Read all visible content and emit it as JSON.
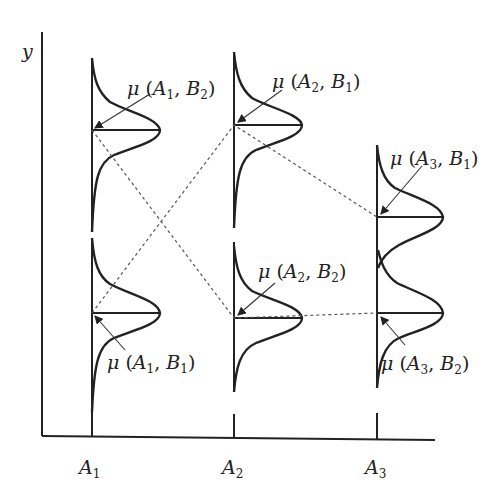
{
  "diagram": {
    "y_axis_label": "y",
    "x_axis_levels": [
      {
        "label": "A",
        "sub": "1"
      },
      {
        "label": "A",
        "sub": "2"
      },
      {
        "label": "A",
        "sub": "3"
      }
    ],
    "distributions": [
      {
        "factor_a": "A1",
        "factor_b": "B2",
        "position": "upper"
      },
      {
        "factor_a": "A1",
        "factor_b": "B1",
        "position": "lower"
      },
      {
        "factor_a": "A2",
        "factor_b": "B1",
        "position": "upper"
      },
      {
        "factor_a": "A2",
        "factor_b": "B2",
        "position": "lower"
      },
      {
        "factor_a": "A3",
        "factor_b": "B1",
        "position": "upper"
      },
      {
        "factor_a": "A3",
        "factor_b": "B2",
        "position": "lower"
      }
    ],
    "labels": {
      "a1b2": {
        "mu": "μ",
        "open": " (",
        "A": "A",
        "As": "1",
        "sep": ", ",
        "B": "B",
        "Bs": "2",
        "close": ")"
      },
      "a1b1": {
        "mu": "μ",
        "open": " (",
        "A": "A",
        "As": "1",
        "sep": ", ",
        "B": "B",
        "Bs": "1",
        "close": ")"
      },
      "a2b1": {
        "mu": "μ",
        "open": " (",
        "A": "A",
        "As": "2",
        "sep": ", ",
        "B": "B",
        "Bs": "1",
        "close": ")"
      },
      "a2b2": {
        "mu": "μ",
        "open": " (",
        "A": "A",
        "As": "2",
        "sep": ", ",
        "B": "B",
        "Bs": "2",
        "close": ")"
      },
      "a3b1": {
        "mu": "μ",
        "open": " (",
        "A": "A",
        "As": "3",
        "sep": ", ",
        "B": "B",
        "Bs": "1",
        "close": ")"
      },
      "a3b2": {
        "mu": "μ",
        "open": " (",
        "A": "A",
        "As": "3",
        "sep": ", ",
        "B": "B",
        "Bs": "2",
        "close": ")"
      }
    },
    "connections": [
      {
        "from": "μ(A1,B2)",
        "to": "μ(A2,B2)",
        "line": "B2 profile",
        "style": "dashed"
      },
      {
        "from": "μ(A2,B2)",
        "to": "μ(A3,B2)",
        "line": "B2 profile",
        "style": "dashed"
      },
      {
        "from": "μ(A1,B1)",
        "to": "μ(A2,B1)",
        "line": "B1 profile",
        "style": "dashed"
      },
      {
        "from": "μ(A2,B1)",
        "to": "μ(A3,B1)",
        "line": "B1 profile",
        "style": "dashed"
      }
    ],
    "colors": {
      "ink": "#222222",
      "dashed": "#555555",
      "background": "#ffffff"
    }
  }
}
